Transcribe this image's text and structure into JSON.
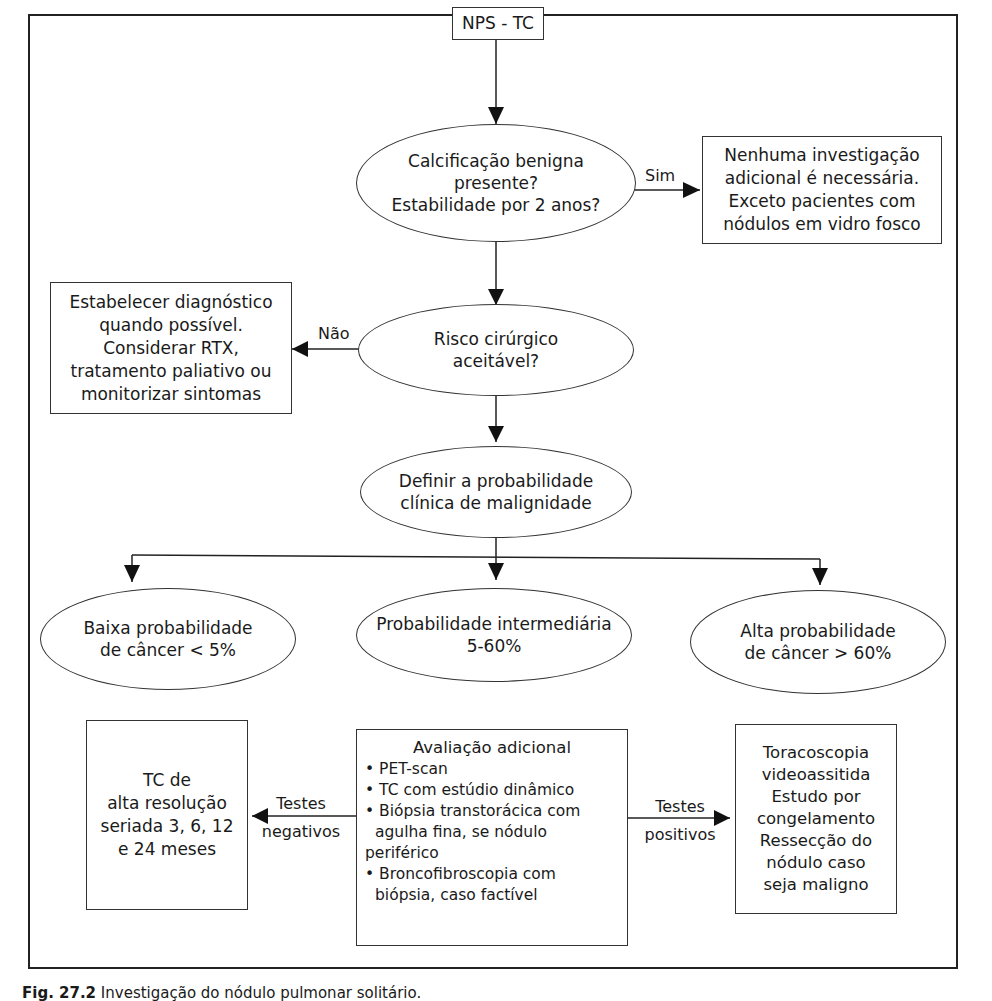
{
  "nodes": {
    "start": {
      "text": "NPS - TC"
    },
    "calc": {
      "lines": [
        "Calcificação benigna",
        "presente?",
        "Estabilidade por 2 anos?"
      ]
    },
    "no_further": {
      "lines": [
        "Nenhuma investigação",
        "adicional é necessária.",
        "Exceto pacientes com",
        "nódulos em vidro fosco"
      ]
    },
    "risk": {
      "lines": [
        "Risco cirúrgico",
        "aceitável?"
      ]
    },
    "diag": {
      "lines": [
        "Estabelecer diagnóstico",
        "quando possível.",
        "Considerar RTX,",
        "tratamento paliativo ou",
        "monitorizar sintomas"
      ]
    },
    "define": {
      "lines": [
        "Definir a probabilidade",
        "clínica de malignidade"
      ]
    },
    "low": {
      "lines": [
        "Baixa probabilidade",
        "de câncer < 5%"
      ]
    },
    "mid": {
      "lines": [
        "Probabilidade intermediária",
        "5-60%"
      ]
    },
    "high": {
      "lines": [
        "Alta probabilidade",
        "de câncer > 60%"
      ]
    },
    "tc": {
      "lines": [
        "TC de",
        "alta resolução",
        "seriada 3, 6, 12",
        "e 24 meses"
      ]
    },
    "eval": {
      "title": "Avaliação adicional",
      "items": [
        "• PET-scan",
        "• TC com estúdio dinâmico",
        "• Biópsia transtorácica com",
        "  agulha fina, se nódulo",
        "periférico",
        "• Broncofibroscopia com",
        "  biópsia, caso factível"
      ]
    },
    "vats": {
      "lines": [
        "Toracoscopia",
        "videoassitida",
        "Estudo por",
        "congelamento",
        "Ressecção do",
        "nódulo caso",
        "seja maligno"
      ]
    }
  },
  "edges": {
    "sim": "Sim",
    "nao": "Não",
    "neg": [
      "Testes",
      "negativos"
    ],
    "pos": [
      "Testes",
      "positivos"
    ]
  },
  "caption": {
    "label": "Fig. 27.2",
    "text": "Investigação do nódulo pulmonar solitário."
  }
}
